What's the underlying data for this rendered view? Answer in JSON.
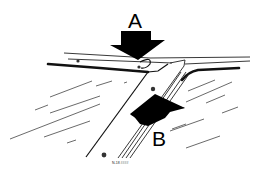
{
  "diagram": {
    "callouts": [
      {
        "id": "A",
        "label": "A",
        "pointer": "arrow-down",
        "target": "upper molding clip"
      },
      {
        "id": "B",
        "label": "B",
        "pointer": "arrow-up",
        "target": "pillar molding channel"
      }
    ],
    "figure_code": "N-18 ####",
    "colors": {
      "ink": "#000000",
      "background": "#ffffff",
      "hatch": "#444444"
    }
  }
}
